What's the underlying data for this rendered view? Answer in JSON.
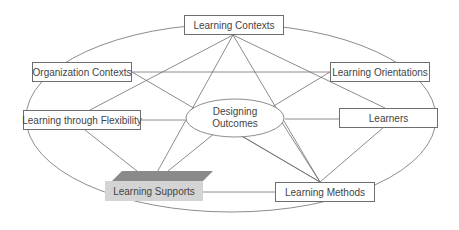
{
  "diagram": {
    "center": {
      "line1": "Designing",
      "line2": "Outcomes"
    },
    "nodes": {
      "learning_contexts": "Learning Contexts",
      "organization_contexts": "Organization Contexts",
      "learning_orientations": "Learning Orientations",
      "learning_through_flexibility": "Learning through Flexibility",
      "learners": "Learners",
      "learning_supports": "Learning Supports",
      "learning_methods": "Learning Methods"
    },
    "colors": {
      "line": "#6e6e6e",
      "highlight_fill": "#d4d4d4",
      "highlight_top": "#8a8a8a",
      "text": "#444444"
    }
  }
}
